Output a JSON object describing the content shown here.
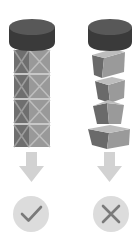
{
  "diagram": {
    "title": "",
    "panels": [
      {
        "id": "correct",
        "label": "",
        "description": "Aligned stack of crossed crates under cap",
        "block_count": 4,
        "result_icon": "checkmark-icon",
        "result": "correct"
      },
      {
        "id": "incorrect",
        "label": "",
        "description": "Misaligned, tilted stack of blocks under cap",
        "block_count": 4,
        "result_icon": "x-mark-icon",
        "result": "incorrect"
      }
    ]
  },
  "colors": {
    "background": "#ffffff",
    "cap_top": "#5a5a5a",
    "cap_side": "#3a3a3a",
    "block_dark_face": "#6f6f6f",
    "block_light_face": "#9a9a9a",
    "block_top": "#b8b8b8",
    "crate_cross": "#b0b0b0",
    "arrow": "#d2d2d2",
    "result_circle": "#dcdcdc",
    "result_glyph": "#7a7a7a"
  }
}
